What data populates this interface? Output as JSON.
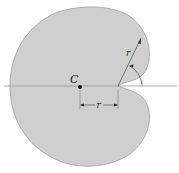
{
  "diagram": {
    "type": "cardioid-area-centroid",
    "labels": {
      "centroid": "C",
      "radius_slant": "r",
      "radius_dim": "r"
    },
    "colors": {
      "fill": "#cfcfcf",
      "stroke": "#9a9a9a",
      "axis": "#8a8a8a",
      "ink": "#222222",
      "background": "#ffffff"
    }
  }
}
